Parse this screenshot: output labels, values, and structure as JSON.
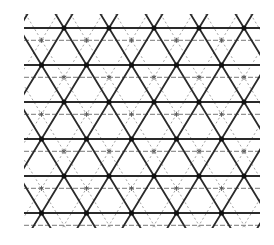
{
  "figure": {
    "colors": {
      "background": "#ffffff",
      "solid_line": "#2a2a2a",
      "node": "#111111",
      "faint_line": "#8a8a8a",
      "star": "#555555"
    },
    "lattice": {
      "rows_y": [
        28,
        65,
        102,
        139,
        176,
        213
      ],
      "even_row_x_start": 64,
      "odd_row_x_start": 41.5,
      "spacing_x": 45,
      "nodes_per_row": 5,
      "line_x_min": 24,
      "line_x_max": 260,
      "y_min": 14,
      "y_max": 228
    },
    "secondary_lattice": {
      "offset_x": 22.5,
      "offset_y": 12.3,
      "style": "dashed"
    }
  }
}
